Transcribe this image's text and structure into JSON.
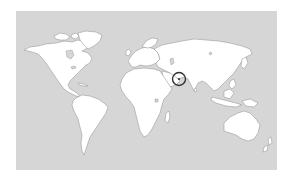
{
  "map": {
    "type": "world-locator",
    "projection": "equirectangular-style world outline",
    "colors": {
      "ocean": "#d6d6d6",
      "land": "#ffffff",
      "coastline": "#8c8c8c",
      "marker": "#333333",
      "page_background": "#ffffff"
    },
    "highlight": {
      "label": "Sri Lanka",
      "shape": "circle",
      "cx": 179,
      "cy": 79,
      "r": 6.5
    },
    "continents": [
      "North America",
      "Greenland",
      "South America",
      "Europe",
      "Africa",
      "Asia",
      "Australia",
      "New Zealand",
      "Madagascar"
    ]
  }
}
